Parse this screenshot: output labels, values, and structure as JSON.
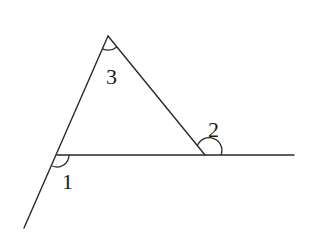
{
  "diagram": {
    "type": "geometry-triangle-exterior-angles",
    "stroke_color": "#2a2a2a",
    "background": "#ffffff",
    "points": {
      "A": {
        "x": 108,
        "y": 36
      },
      "B": {
        "x": 57,
        "y": 155
      },
      "C": {
        "x": 205,
        "y": 155
      }
    },
    "lines": [
      {
        "name": "side-AB-extended",
        "x1": 108,
        "y1": 36,
        "x2": 24,
        "y2": 228
      },
      {
        "name": "side-AC",
        "x1": 108,
        "y1": 36,
        "x2": 205,
        "y2": 155
      },
      {
        "name": "base-BC-extended",
        "x1": 57,
        "y1": 155,
        "x2": 294,
        "y2": 155
      }
    ],
    "angles": [
      {
        "id": "1",
        "label": "1",
        "vertex": "B",
        "label_x": 62,
        "label_y": 189
      },
      {
        "id": "2",
        "label": "2",
        "vertex": "C",
        "label_x": 208,
        "label_y": 137
      },
      {
        "id": "3",
        "label": "3",
        "vertex": "A",
        "label_x": 106,
        "label_y": 84
      }
    ]
  }
}
